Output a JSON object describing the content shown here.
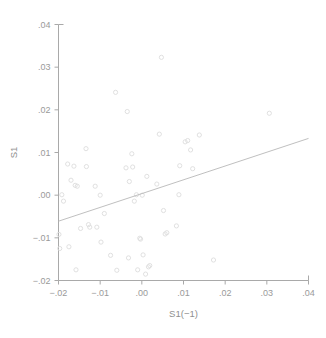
{
  "chart_data": {
    "type": "scatter",
    "title": "",
    "subtitle": "",
    "xlabel": "S1(−1)",
    "ylabel": "S1",
    "xlim": [
      -0.02,
      0.04
    ],
    "ylim": [
      -0.02,
      0.04
    ],
    "grid": false,
    "legend": null,
    "xticks": [
      -0.02,
      -0.01,
      0.0,
      0.01,
      0.02,
      0.03,
      0.04
    ],
    "yticks": [
      -0.02,
      -0.01,
      0.0,
      0.01,
      0.02,
      0.03,
      0.04
    ],
    "xticklabels": [
      "−.02",
      "−.01",
      ".00",
      ".01",
      ".02",
      ".03",
      ".04"
    ],
    "yticklabels": [
      "−.02",
      "−.01",
      ".00",
      ".01",
      ".02",
      ".03",
      ".04"
    ],
    "marker": "open-circle",
    "marker_color": "#dcdcdc",
    "line_color": "#b8b8b8",
    "axis_color": "#a9a9a9",
    "text_color": "#9a9a9a",
    "fit_line": {
      "type": "linear",
      "x_start": -0.02,
      "y_start": -0.0061,
      "x_end": 0.04,
      "y_end": 0.0133,
      "slope": 0.3233,
      "intercept": 0.00037
    },
    "points": [
      {
        "x": -0.0199,
        "y": -0.0092
      },
      {
        "x": -0.0197,
        "y": -0.0125
      },
      {
        "x": -0.0192,
        "y": 0.0001
      },
      {
        "x": -0.0188,
        "y": -0.0014
      },
      {
        "x": -0.0178,
        "y": 0.0073
      },
      {
        "x": -0.0175,
        "y": -0.0121
      },
      {
        "x": -0.017,
        "y": 0.0035
      },
      {
        "x": -0.0163,
        "y": 0.0068
      },
      {
        "x": -0.016,
        "y": 0.0023
      },
      {
        "x": -0.0158,
        "y": -0.0175
      },
      {
        "x": -0.0155,
        "y": 0.0021
      },
      {
        "x": -0.0147,
        "y": -0.0078
      },
      {
        "x": -0.0134,
        "y": 0.0109
      },
      {
        "x": -0.0133,
        "y": 0.0067
      },
      {
        "x": -0.0128,
        "y": -0.0069
      },
      {
        "x": -0.0125,
        "y": -0.0075
      },
      {
        "x": -0.0112,
        "y": 0.0021
      },
      {
        "x": -0.0108,
        "y": -0.0075
      },
      {
        "x": -0.01,
        "y": 0.0
      },
      {
        "x": -0.0098,
        "y": -0.011
      },
      {
        "x": -0.009,
        "y": -0.0043
      },
      {
        "x": -0.0075,
        "y": -0.0141
      },
      {
        "x": -0.0063,
        "y": 0.0241
      },
      {
        "x": -0.006,
        "y": -0.0176
      },
      {
        "x": -0.0038,
        "y": 0.0064
      },
      {
        "x": -0.0035,
        "y": 0.0196
      },
      {
        "x": -0.0032,
        "y": -0.0147
      },
      {
        "x": -0.003,
        "y": 0.0032
      },
      {
        "x": -0.0024,
        "y": 0.0097
      },
      {
        "x": -0.0022,
        "y": 0.0066
      },
      {
        "x": -0.0018,
        "y": -0.0014
      },
      {
        "x": -0.0013,
        "y": 0.0001
      },
      {
        "x": -0.001,
        "y": -0.0175
      },
      {
        "x": -0.0005,
        "y": -0.0101
      },
      {
        "x": -0.0003,
        "y": -0.0103
      },
      {
        "x": 0.0001,
        "y": 0.0
      },
      {
        "x": 0.0003,
        "y": -0.014
      },
      {
        "x": 0.0009,
        "y": -0.0185
      },
      {
        "x": 0.0012,
        "y": 0.0044
      },
      {
        "x": 0.0016,
        "y": -0.0168
      },
      {
        "x": 0.0019,
        "y": -0.0165
      },
      {
        "x": 0.0036,
        "y": 0.0026
      },
      {
        "x": 0.0042,
        "y": 0.0143
      },
      {
        "x": 0.0047,
        "y": 0.0323
      },
      {
        "x": 0.0052,
        "y": -0.0036
      },
      {
        "x": 0.0056,
        "y": -0.0091
      },
      {
        "x": 0.006,
        "y": -0.0088
      },
      {
        "x": 0.0083,
        "y": -0.0072
      },
      {
        "x": 0.0089,
        "y": 0.0001
      },
      {
        "x": 0.0091,
        "y": 0.0069
      },
      {
        "x": 0.0104,
        "y": 0.0125
      },
      {
        "x": 0.011,
        "y": 0.0128
      },
      {
        "x": 0.0117,
        "y": 0.0106
      },
      {
        "x": 0.0122,
        "y": 0.0062
      },
      {
        "x": 0.0138,
        "y": 0.0141
      },
      {
        "x": 0.0172,
        "y": -0.0152
      },
      {
        "x": 0.0306,
        "y": 0.0192
      }
    ]
  },
  "figure": {
    "background": "#ffffff"
  }
}
